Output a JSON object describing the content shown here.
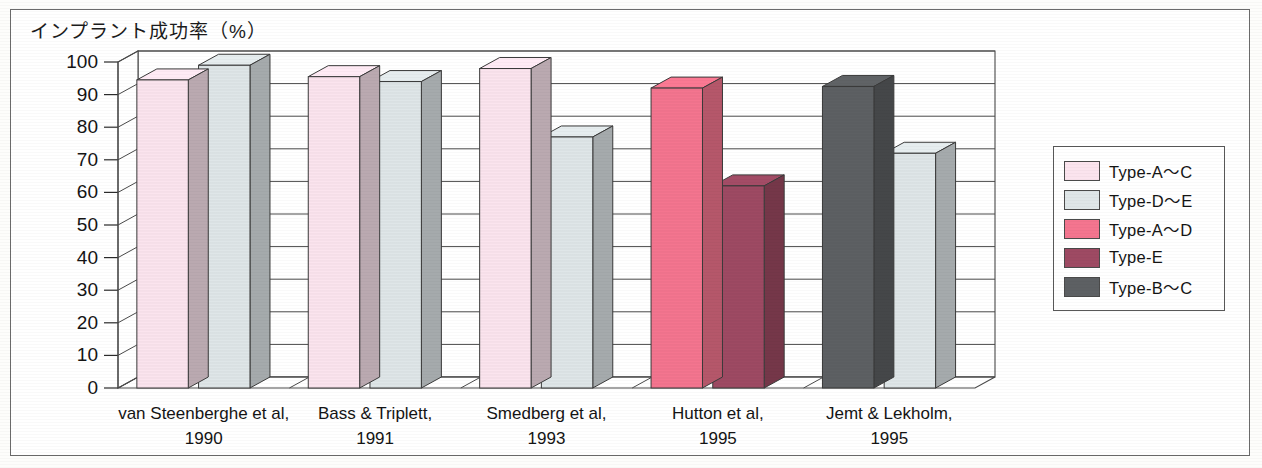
{
  "figure": {
    "axis_title": "インプラント成功率（%）"
  },
  "chart_data": {
    "type": "bar",
    "title": "インプラント成功率（%）",
    "xlabel": "",
    "ylabel": "インプラント成功率（%）",
    "ylim": [
      0,
      100
    ],
    "ytick_values": [
      0,
      10,
      20,
      30,
      40,
      50,
      60,
      70,
      80,
      90,
      100
    ],
    "ytick_labels": [
      "0",
      "10",
      "20",
      "30",
      "40",
      "50",
      "60",
      "70",
      "80",
      "90",
      "100"
    ],
    "grid": true,
    "legend_position": "right",
    "three_d": true,
    "categories": [
      "van Steenberghe et al, 1990",
      "Bass & Triplett, 1991",
      "Smedberg et al, 1993",
      "Hutton et al, 1995",
      "Jemt & Lekholm, 1995"
    ],
    "category_lines": [
      {
        "name": "van Steenberghe et al,",
        "year": "1990"
      },
      {
        "name": "Bass & Triplett,",
        "year": "1991"
      },
      {
        "name": "Smedberg et al,",
        "year": "1993"
      },
      {
        "name": "Hutton et al,",
        "year": "1995"
      },
      {
        "name": "Jemt & Lekholm,",
        "year": "1995"
      }
    ],
    "series": [
      {
        "name": "Type-A～C",
        "color": "#fbe4ee",
        "values": [
          94.5,
          95.5,
          98,
          null,
          null
        ]
      },
      {
        "name": "Type-D～E",
        "color": "#dfe6e8",
        "values": [
          99,
          94,
          77,
          null,
          72
        ]
      },
      {
        "name": "Type-A～D",
        "color": "#f4758f",
        "values": [
          null,
          null,
          null,
          92,
          null
        ]
      },
      {
        "name": "Type-E",
        "color": "#9e4a63",
        "values": [
          null,
          null,
          null,
          62,
          null
        ]
      },
      {
        "name": "Type-B～C",
        "color": "#5d6063",
        "values": [
          null,
          null,
          null,
          null,
          92.5
        ]
      }
    ],
    "bars": [
      {
        "group": 0,
        "slot": 0,
        "series": "Type-A～C",
        "value": 94.5,
        "color": "#fbe4ee"
      },
      {
        "group": 0,
        "slot": 1,
        "series": "Type-D～E",
        "value": 99,
        "color": "#dfe6e8"
      },
      {
        "group": 1,
        "slot": 0,
        "series": "Type-A～C",
        "value": 95.5,
        "color": "#fbe4ee"
      },
      {
        "group": 1,
        "slot": 1,
        "series": "Type-D～E",
        "value": 94,
        "color": "#dfe6e8"
      },
      {
        "group": 2,
        "slot": 0,
        "series": "Type-A～C",
        "value": 98,
        "color": "#fbe4ee"
      },
      {
        "group": 2,
        "slot": 1,
        "series": "Type-D～E",
        "value": 77,
        "color": "#dfe6e8"
      },
      {
        "group": 3,
        "slot": 0,
        "series": "Type-A～D",
        "value": 92,
        "color": "#f4758f"
      },
      {
        "group": 3,
        "slot": 1,
        "series": "Type-E",
        "value": 62,
        "color": "#9e4a63"
      },
      {
        "group": 4,
        "slot": 0,
        "series": "Type-B～C",
        "value": 92.5,
        "color": "#5d6063"
      },
      {
        "group": 4,
        "slot": 1,
        "series": "Type-D～E",
        "value": 72,
        "color": "#dfe6e8"
      }
    ]
  },
  "legend": {
    "items": [
      {
        "label": "Type-A～C",
        "color": "#fbe4ee"
      },
      {
        "label": "Type-D～E",
        "color": "#dfe6e8"
      },
      {
        "label": "Type-A～D",
        "color": "#f4758f"
      },
      {
        "label": "Type-E",
        "color": "#9e4a63"
      },
      {
        "label": "Type-B～C",
        "color": "#5d6063"
      }
    ]
  }
}
